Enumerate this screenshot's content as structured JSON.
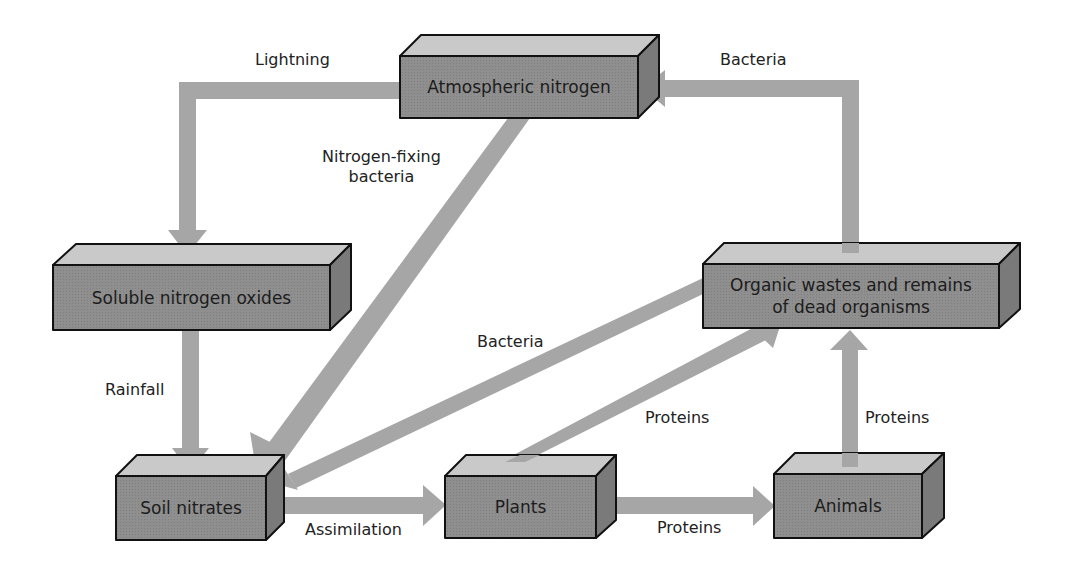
{
  "diagram": {
    "type": "nitrogen cycle flow diagram",
    "colors": {
      "box_front": "#8f8f8f",
      "box_top": "#c9c9c9",
      "box_side": "#7a7a7a",
      "arrow": "#a6a6a6",
      "outline": "#111111",
      "text": "#222222"
    },
    "nodes": [
      {
        "id": "atmospheric",
        "label": "Atmospheric nitrogen"
      },
      {
        "id": "soluble",
        "label": "Soluble nitrogen oxides"
      },
      {
        "id": "organic",
        "label": "Organic wastes and remains\nof dead organisms"
      },
      {
        "id": "soil",
        "label": "Soil nitrates"
      },
      {
        "id": "plants",
        "label": "Plants"
      },
      {
        "id": "animals",
        "label": "Animals"
      }
    ],
    "edges": [
      {
        "from": "atmospheric",
        "to": "soluble",
        "label": "Lightning"
      },
      {
        "from": "organic",
        "to": "atmospheric",
        "label": "Bacteria"
      },
      {
        "from": "atmospheric",
        "to": "soil",
        "label": "Nitrogen-fixing\nbacteria"
      },
      {
        "from": "soluble",
        "to": "soil",
        "label": "Rainfall"
      },
      {
        "from": "organic",
        "to": "soil",
        "label": "Bacteria"
      },
      {
        "from": "soil",
        "to": "plants",
        "label": "Assimilation"
      },
      {
        "from": "plants",
        "to": "animals",
        "label": "Proteins"
      },
      {
        "from": "plants",
        "to": "organic",
        "label": "Proteins"
      },
      {
        "from": "animals",
        "to": "organic",
        "label": "Proteins"
      }
    ]
  }
}
